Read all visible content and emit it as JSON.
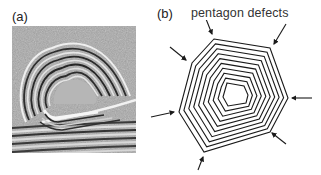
{
  "panels": [
    {
      "id": "a",
      "label": "(a)",
      "content": "TEM micrograph of nested graphitic shells around a faceted core on a layered substrate"
    },
    {
      "id": "b",
      "label": "(b)",
      "content": "Schematic of nested heptagonal shells"
    }
  ],
  "annotation": "pentagon defects",
  "colors": {
    "line": "#1a1a1a",
    "text": "#222222",
    "tem_background": "#a8a8a8"
  },
  "diagram": {
    "shell_count": 10,
    "outer_vertices": [
      [
        64,
        19
      ],
      [
        120,
        28
      ],
      [
        138,
        78
      ],
      [
        120,
        112
      ],
      [
        54,
        132
      ],
      [
        29,
        92
      ],
      [
        42,
        43
      ]
    ],
    "inner_vertices": [
      [
        77,
        63
      ],
      [
        94,
        66
      ],
      [
        98,
        75
      ],
      [
        96,
        83
      ],
      [
        78,
        86
      ],
      [
        73,
        77
      ]
    ],
    "arrows": [
      {
        "from": [
          56,
          -1
        ],
        "to": [
          62,
          14
        ]
      },
      {
        "from": [
          136,
          4
        ],
        "to": [
          124,
          24
        ]
      },
      {
        "from": [
          20,
          27
        ],
        "to": [
          36,
          40
        ]
      },
      {
        "from": [
          162,
          78
        ],
        "to": [
          142,
          78
        ]
      },
      {
        "from": [
          136,
          124
        ],
        "to": [
          122,
          113
        ]
      },
      {
        "from": [
          1,
          97
        ],
        "to": [
          24,
          92
        ]
      },
      {
        "from": [
          48,
          150
        ],
        "to": [
          53,
          137
        ]
      }
    ]
  }
}
